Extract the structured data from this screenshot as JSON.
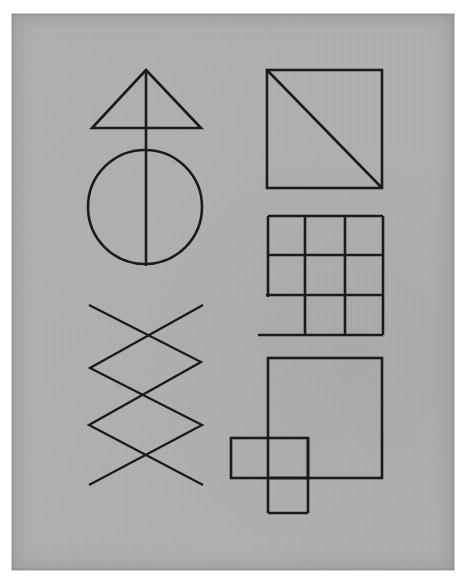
{
  "page": {
    "background_color": "#ffffff",
    "paper_color": "#b3b3b3",
    "ink_color": "#1b1b1b",
    "width": 468,
    "height": 584
  },
  "sheet": {
    "x": 12,
    "y": 14,
    "width": 442,
    "height": 556,
    "description": "Grey photocopied paper sheet with nine hand-drawn geometric figures in black ink"
  },
  "figures": [
    {
      "id": "triangle-with-stem",
      "name": "triangle-figure",
      "shape": "triangle",
      "apex": [
        146,
        70
      ],
      "base_left": [
        92,
        128
      ],
      "base_right": [
        201,
        128
      ],
      "stem": {
        "from": [
          146,
          70
        ],
        "to": [
          146,
          266
        ]
      }
    },
    {
      "id": "circle-with-diameter",
      "name": "circle-figure",
      "shape": "circle",
      "center": [
        145,
        207
      ],
      "radius": 57,
      "diameter_line": {
        "from": [
          145,
          150
        ],
        "to": [
          145,
          266
        ]
      }
    },
    {
      "id": "zigzag-lines",
      "name": "zigzag-figure",
      "shape": "polyline-pair",
      "polyline_a": [
        [
          89,
          305
        ],
        [
          201,
          362
        ],
        [
          89,
          425
        ],
        [
          203,
          485
        ]
      ],
      "polyline_b": [
        [
          203,
          305
        ],
        [
          90,
          368
        ],
        [
          202,
          425
        ],
        [
          89,
          485
        ]
      ]
    },
    {
      "id": "square-with-diagonal",
      "name": "square-diagonal-figure",
      "shape": "square",
      "rect": [
        267,
        70,
        115,
        118
      ],
      "diagonal": {
        "from": [
          267,
          70
        ],
        "to": [
          382,
          188
        ]
      }
    },
    {
      "id": "nine-cell-grid",
      "name": "grid-figure",
      "shape": "grid",
      "rect": [
        268,
        216,
        115,
        119
      ],
      "vertical_lines_x": [
        305,
        345
      ],
      "horizontal_lines_y": [
        255,
        295
      ],
      "notes": "left border stops at the lower horizontal line; bottom-left cell has no left wall"
    },
    {
      "id": "overlapping-squares",
      "name": "overlapping-squares-figure",
      "shape": "overlapping-rectangles",
      "large_rect": [
        268,
        358,
        114,
        120
      ],
      "small_rect": [
        231,
        438,
        77,
        40
      ],
      "tab_rect": [
        268,
        478,
        40,
        35
      ]
    }
  ]
}
